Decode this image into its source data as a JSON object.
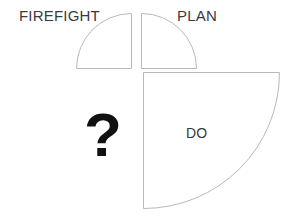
{
  "diagram": {
    "background_color": "#ffffff",
    "stroke_color": "#b9b9b9",
    "fill_color": "#ffffff",
    "label_color": "#3a3a3a",
    "question_color": "#111111",
    "center": {
      "x": 137,
      "y": 70
    },
    "quadrants": [
      {
        "id": "firefight",
        "position": "top-left",
        "label": "FIREFIGHT",
        "label_placement": "outside-above-left",
        "radius": 55,
        "has_wedge": true
      },
      {
        "id": "plan",
        "position": "top-right",
        "label": "PLAN",
        "label_placement": "outside-above-right",
        "radius": 55,
        "has_wedge": true
      },
      {
        "id": "do",
        "position": "bottom-right",
        "label": "DO",
        "label_placement": "inside",
        "radius": 142,
        "has_wedge": true
      },
      {
        "id": "unknown",
        "position": "bottom-left",
        "label": "?",
        "label_placement": "inside",
        "radius": 0,
        "has_wedge": false
      }
    ]
  },
  "shapes": {
    "top_left_wedge_path": "M 76.5 68.5 L 131.5 68.5 L 131.5 13.5 A 55 55 0 0 0 76.5 68.5 Z",
    "top_right_wedge_path": "M 196.5 68.5 L 141.5 68.5 L 141.5 13.5 A 55 55 0 0 1 196.5 68.5 Z",
    "bottom_right_wedge_path": "M 143.5 72.5 L 143.5 208.5 A 136 136 0 0 0 279.5 72.5 Z"
  }
}
